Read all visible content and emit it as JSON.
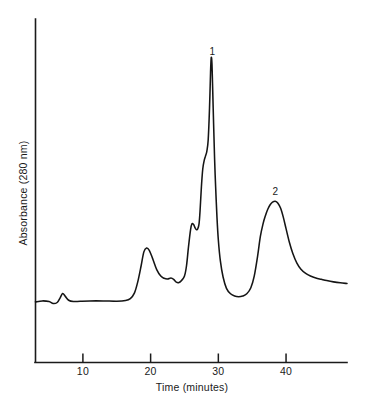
{
  "chart_data": {
    "type": "line",
    "title": "",
    "xlabel": "Time (minutes)",
    "ylabel": "Absorbance (280 nm)",
    "xlim": [
      3,
      49
    ],
    "ylim": [
      0,
      1
    ],
    "grid": false,
    "legend": "none",
    "xticks": [
      10,
      20,
      30,
      40
    ],
    "xticklabels": [
      "10",
      "20",
      "30",
      "40"
    ],
    "yticks": [],
    "yticklabels": [],
    "annotations": [
      {
        "label": "1",
        "x": 29.1,
        "y": 0.955
      },
      {
        "label": "2",
        "x": 38.4,
        "y": 0.52
      }
    ],
    "series": [
      {
        "name": "Absorbance trace",
        "x": [
          3.0,
          4.0,
          5.0,
          5.6,
          6.2,
          6.6,
          7.0,
          7.4,
          7.9,
          8.6,
          9.6,
          11.0,
          13.0,
          15.0,
          16.3,
          17.0,
          17.6,
          18.1,
          18.6,
          19.0,
          19.4,
          19.8,
          20.3,
          20.9,
          21.5,
          22.0,
          22.5,
          23.0,
          23.4,
          23.8,
          24.2,
          24.6,
          25.0,
          25.3,
          25.6,
          25.9,
          26.1,
          26.35,
          26.55,
          26.75,
          26.95,
          27.15,
          27.3,
          27.5,
          27.7,
          27.9,
          28.1,
          28.3,
          28.5,
          28.7,
          28.85,
          28.95,
          29.05,
          29.15,
          29.3,
          29.45,
          29.6,
          29.8,
          30.0,
          30.3,
          30.7,
          31.2,
          31.8,
          32.4,
          33.0,
          33.6,
          34.2,
          34.8,
          35.3,
          35.8,
          36.2,
          36.6,
          36.95,
          37.3,
          37.65,
          38.0,
          38.4,
          38.8,
          39.2,
          39.6,
          40.0,
          40.5,
          41.0,
          41.6,
          42.2,
          42.9,
          43.6,
          44.4,
          45.2,
          46.0,
          47.0,
          48.0,
          49.0
        ],
        "y": [
          0.188,
          0.191,
          0.189,
          0.183,
          0.186,
          0.199,
          0.214,
          0.205,
          0.193,
          0.189,
          0.19,
          0.191,
          0.191,
          0.19,
          0.192,
          0.198,
          0.215,
          0.25,
          0.3,
          0.343,
          0.355,
          0.348,
          0.322,
          0.288,
          0.268,
          0.261,
          0.259,
          0.262,
          0.258,
          0.249,
          0.248,
          0.255,
          0.268,
          0.3,
          0.36,
          0.412,
          0.43,
          0.428,
          0.418,
          0.412,
          0.414,
          0.43,
          0.47,
          0.545,
          0.6,
          0.625,
          0.64,
          0.655,
          0.69,
          0.79,
          0.9,
          0.945,
          0.93,
          0.86,
          0.74,
          0.63,
          0.545,
          0.45,
          0.38,
          0.315,
          0.265,
          0.23,
          0.213,
          0.206,
          0.204,
          0.206,
          0.213,
          0.232,
          0.268,
          0.33,
          0.39,
          0.43,
          0.455,
          0.475,
          0.489,
          0.497,
          0.5,
          0.494,
          0.478,
          0.45,
          0.415,
          0.372,
          0.338,
          0.308,
          0.289,
          0.276,
          0.268,
          0.262,
          0.258,
          0.254,
          0.25,
          0.247,
          0.245
        ]
      }
    ]
  },
  "axes": {
    "x_axis_name": "time-axis",
    "y_axis_name": "absorbance-axis"
  }
}
